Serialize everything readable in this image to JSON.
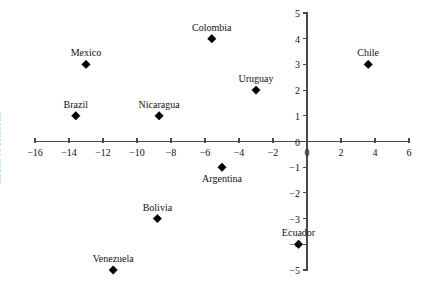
{
  "chart_data": {
    "type": "scatter",
    "title": "",
    "subtitle": "",
    "xlabel": "",
    "ylabel": "Index of Reform",
    "xlim": [
      -16,
      6
    ],
    "ylim": [
      -5,
      5
    ],
    "xticks": [
      -16,
      -14,
      -12,
      -10,
      -8,
      -6,
      -4,
      -2,
      0,
      2,
      4,
      6
    ],
    "xtick_labels": [
      "−16",
      "−14",
      "−12",
      "−10",
      "−8",
      "−6",
      "−4",
      "−2",
      "0",
      "2",
      "4",
      "6"
    ],
    "yticks": [
      5,
      4,
      3,
      2,
      1,
      0,
      -1,
      -2,
      -3,
      -4,
      -5
    ],
    "ytick_labels": [
      "5",
      "4",
      "3",
      "2",
      "1",
      "0",
      "−1",
      "−2",
      "−3",
      "−4",
      "−5"
    ],
    "grid": false,
    "legend": "none",
    "marker": "diamond",
    "marker_color": "#000000",
    "axis_color": "#4a4a4a",
    "points": [
      {
        "label": "Colombia",
        "x": -5.6,
        "y": 4,
        "label_pos": "above"
      },
      {
        "label": "Chile",
        "x": 3.6,
        "y": 3,
        "label_pos": "above"
      },
      {
        "label": "Mexico",
        "x": -13.0,
        "y": 3,
        "label_pos": "above"
      },
      {
        "label": "Uruguay",
        "x": -3.0,
        "y": 2,
        "label_pos": "above"
      },
      {
        "label": "Brazil",
        "x": -13.6,
        "y": 1,
        "label_pos": "above"
      },
      {
        "label": "Nicaragua",
        "x": -8.7,
        "y": 1,
        "label_pos": "above"
      },
      {
        "label": "Argentina",
        "x": -5.0,
        "y": -1,
        "label_pos": "below"
      },
      {
        "label": "Bolivia",
        "x": -8.8,
        "y": -3,
        "label_pos": "above"
      },
      {
        "label": "Ecuador",
        "x": -0.5,
        "y": -4,
        "label_pos": "above"
      },
      {
        "label": "Venezuela",
        "x": -11.4,
        "y": -5,
        "label_pos": "above"
      }
    ]
  }
}
